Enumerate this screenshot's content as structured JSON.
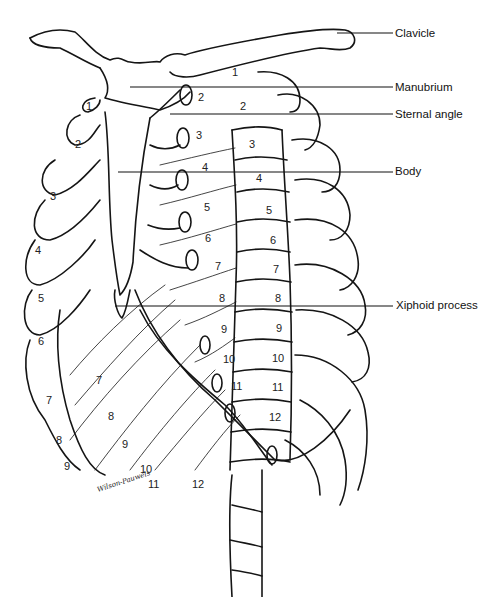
{
  "diagram": {
    "type": "anatomical-line-drawing",
    "labels": [
      {
        "id": "clavicle",
        "text": "Clavicle",
        "x": 395,
        "y": 27,
        "line_from_x": 337,
        "line_y": 33
      },
      {
        "id": "manubrium",
        "text": "Manubrium",
        "x": 395,
        "y": 81,
        "line_from_x": 130,
        "line_y": 87
      },
      {
        "id": "sternal-angle",
        "text": "Sternal angle",
        "x": 395,
        "y": 108,
        "line_from_x": 170,
        "line_y": 114
      },
      {
        "id": "body",
        "text": "Body",
        "x": 395,
        "y": 165,
        "line_from_x": 118,
        "line_y": 172
      },
      {
        "id": "xiphoid-process",
        "text": "Xiphoid process",
        "x": 396,
        "y": 299,
        "line_from_x": 115,
        "line_y": 306
      }
    ],
    "vertebra_numbers": [
      "1",
      "2",
      "3",
      "4",
      "5",
      "6",
      "7",
      "8",
      "9",
      "10",
      "11",
      "12"
    ],
    "costal_numbers_anterior": [
      "1",
      "2",
      "3",
      "4",
      "5",
      "6",
      "7",
      "8",
      "9",
      "10",
      "11",
      "12"
    ],
    "left_side_rib_numbers": [
      "1",
      "2",
      "3",
      "4",
      "5",
      "6",
      "7",
      "8",
      "9",
      "10"
    ],
    "floating_rib_numbers": [
      "11",
      "12"
    ],
    "signature": "Wilson-Pauwels",
    "line_color": "#111111",
    "background": "#ffffff"
  }
}
